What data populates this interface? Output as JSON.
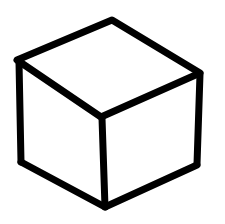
{
  "image": {
    "subject": "hand-drawn cube",
    "stroke_color": "#000000",
    "background_color": "#ffffff"
  }
}
